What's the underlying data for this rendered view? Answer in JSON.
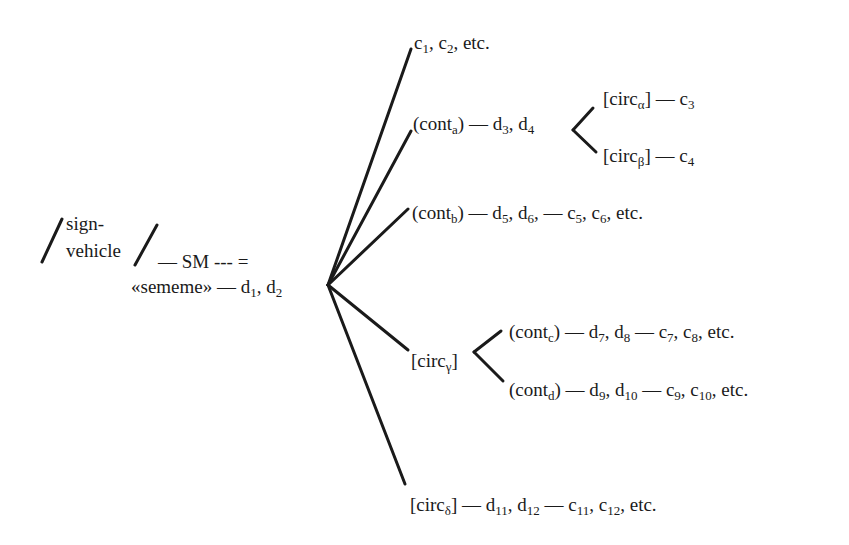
{
  "diagram": {
    "type": "semiotic-tree",
    "root": {
      "sign_vehicle_line1": "sign-",
      "sign_vehicle_line2": "vehicle",
      "sm_text": "— SM --- =",
      "sememe_text": "«sememe» — d",
      "sememe_sub1": "1",
      "sememe_sep": ", d",
      "sememe_sub2": "2"
    },
    "branches": [
      {
        "id": "b1",
        "parts": [
          [
            "c",
            "1"
          ],
          [
            ", c",
            "2"
          ],
          [
            ", etc.",
            ""
          ]
        ]
      },
      {
        "id": "b2",
        "parts": [
          [
            "(cont",
            "a"
          ],
          [
            ") — d",
            "3"
          ],
          [
            ", d",
            "4"
          ]
        ],
        "sub_branches": [
          {
            "id": "b2-alpha",
            "parts": [
              [
                "[circ",
                "α"
              ],
              [
                "] — c",
                "3"
              ]
            ]
          },
          {
            "id": "b2-beta",
            "parts": [
              [
                "[circ",
                "β"
              ],
              [
                "] — c",
                "4"
              ]
            ]
          }
        ]
      },
      {
        "id": "b3",
        "parts": [
          [
            "(cont",
            "b"
          ],
          [
            ") — d",
            "5"
          ],
          [
            ", d",
            "6"
          ],
          [
            ", — c",
            "5"
          ],
          [
            ", c",
            "6"
          ],
          [
            ", etc.",
            ""
          ]
        ]
      },
      {
        "id": "b4",
        "parts": [
          [
            "[circ",
            "γ"
          ],
          [
            "]",
            ""
          ]
        ],
        "sub_branches": [
          {
            "id": "b4-c",
            "parts": [
              [
                "(cont",
                "c"
              ],
              [
                ") — d",
                "7"
              ],
              [
                ", d",
                "8"
              ],
              [
                " — c",
                "7"
              ],
              [
                ", c",
                "8"
              ],
              [
                ", etc.",
                ""
              ]
            ]
          },
          {
            "id": "b4-d",
            "parts": [
              [
                "(cont",
                "d"
              ],
              [
                ") — d",
                "9"
              ],
              [
                ", d",
                "10"
              ],
              [
                " — c",
                "9"
              ],
              [
                ", c",
                "10"
              ],
              [
                ", etc.",
                ""
              ]
            ]
          }
        ]
      },
      {
        "id": "b5",
        "parts": [
          [
            "[circ",
            "δ"
          ],
          [
            "] — d",
            "11"
          ],
          [
            ", d",
            "12"
          ],
          [
            " — c",
            "11"
          ],
          [
            ", c",
            "12"
          ],
          [
            ", etc.",
            ""
          ]
        ]
      }
    ],
    "colors": {
      "ink": "#1a1a1a",
      "background": "#ffffff"
    }
  }
}
